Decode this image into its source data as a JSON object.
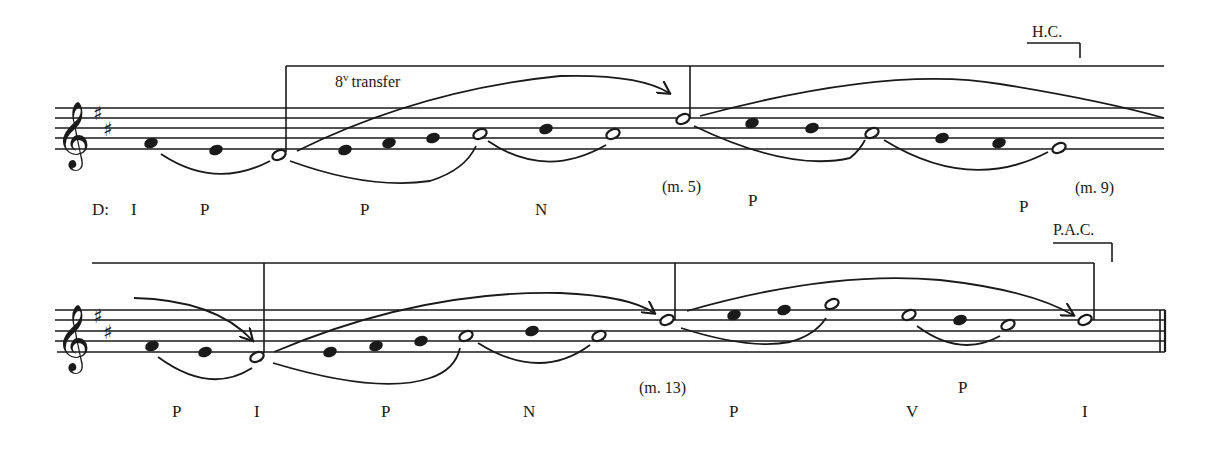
{
  "figure": {
    "key_label": "D:",
    "system1": {
      "annotations": {
        "octave_transfer": "8",
        "octave_transfer_sup": "v",
        "octave_transfer_text": "transfer",
        "cadence": "H.C.",
        "measure_mid": "(m. 5)",
        "measure_end": "(m. 9)"
      },
      "labels": [
        "I",
        "P",
        "P",
        "N",
        "P",
        "P"
      ]
    },
    "system2": {
      "annotations": {
        "cadence": "P.A.C.",
        "measure_mid": "(m. 13)"
      },
      "labels": [
        "P",
        "I",
        "P",
        "N",
        "P",
        "P",
        "V",
        "I"
      ]
    },
    "key_signature": "D major (two sharps)",
    "clef": "treble"
  }
}
